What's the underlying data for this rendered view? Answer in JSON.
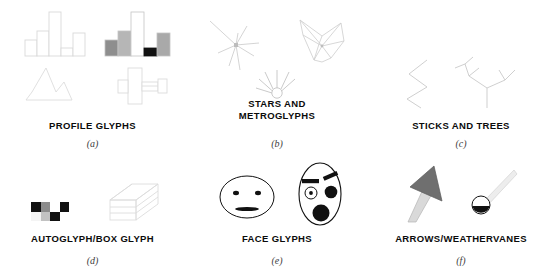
{
  "figure": {
    "title_present": false,
    "panel_count": 6,
    "stroke_color_faint": "#dadada",
    "stroke_color_light": "#c9c9c9",
    "ink_color": "#111111",
    "gray_mid": "#9a9a9a",
    "gray_dark": "#6f6f6f",
    "gray_light": "#cfcfcf"
  },
  "panels": [
    {
      "key": "a",
      "caption": "PROFILE GLYPHS",
      "sublabel": "(a)",
      "glyphs": [
        {
          "name": "outline-bar-profile",
          "type": "bar",
          "fill": "none",
          "bars": [
            {
              "height": 14,
              "fill": "#ffffff"
            },
            {
              "height": 22,
              "fill": "#ffffff"
            },
            {
              "height": 43,
              "fill": "#ffffff"
            },
            {
              "height": 6,
              "fill": "#ffffff"
            },
            {
              "height": 19,
              "fill": "#ffffff"
            }
          ]
        },
        {
          "name": "shaded-bar-profile",
          "type": "bar",
          "fill": "gray-scale",
          "bars": [
            {
              "height": 14,
              "fill": "#8f8f8f"
            },
            {
              "height": 22,
              "fill": "#b4b4b4"
            },
            {
              "height": 43,
              "fill": "#ffffff"
            },
            {
              "height": 6,
              "fill": "#111111"
            },
            {
              "height": 21,
              "fill": "#a8a8a8"
            }
          ]
        },
        {
          "name": "line-profile-glyph",
          "type": "polyline",
          "points": "0,34 6,26 18,2 27,22 34,34"
        },
        {
          "name": "box-profile-glyph",
          "type": "boxed-profile"
        }
      ]
    },
    {
      "key": "b",
      "caption": "STARS AND METROGLYPHS",
      "caption_lines": [
        "STARS AND",
        "METROGLYPHS"
      ],
      "sublabel": "(b)",
      "glyphs": [
        {
          "name": "star-glyph",
          "type": "star-rays",
          "rays": [
            {
              "angle": 205,
              "length": 26
            },
            {
              "angle": 250,
              "length": 12
            },
            {
              "angle": 290,
              "length": 21
            },
            {
              "angle": 330,
              "length": 24
            },
            {
              "angle": 20,
              "length": 14
            },
            {
              "angle": 70,
              "length": 23
            },
            {
              "angle": 120,
              "length": 10
            },
            {
              "angle": 160,
              "length": 18
            }
          ]
        },
        {
          "name": "star-polygon-glyph",
          "type": "star-polygon",
          "vertices": 7
        },
        {
          "name": "metroglyph",
          "type": "metroglyph",
          "circle_radius": 5,
          "ray_count": 6
        }
      ]
    },
    {
      "key": "c",
      "caption": "STICKS AND TREES",
      "sublabel": "(c)",
      "glyphs": [
        {
          "name": "stick-glyph",
          "type": "zigzag",
          "points": "22,2 6,14 22,26 6,38 20,48"
        },
        {
          "name": "tree-glyph",
          "type": "tree",
          "branch_count": 6
        }
      ]
    },
    {
      "key": "d",
      "caption": "AUTOGLYPH/BOX GLYPH",
      "sublabel": "(d)",
      "glyphs": [
        {
          "name": "autoglyph",
          "type": "grid",
          "cols": 4,
          "rows": 2,
          "cells": [
            [
              "#111111",
              "#8c8c8c",
              "#ffffff",
              "#111111"
            ],
            [
              "#f2f2f2",
              "#c2c2c2",
              "#111111",
              "#ffffff"
            ]
          ]
        },
        {
          "name": "box-glyph",
          "type": "3d-box"
        }
      ]
    },
    {
      "key": "e",
      "caption": "FACE GLYPHS",
      "sublabel": "(e)",
      "glyphs": [
        {
          "name": "face-glyph-neutral",
          "type": "face",
          "shape": "wide-oval",
          "eyes": "small-dots",
          "mouth": "flat-wide",
          "brows": "none"
        },
        {
          "name": "face-glyph-expressive",
          "type": "face",
          "shape": "tall-oval",
          "eyes": "mixed-small-large",
          "mouth": "large-round",
          "brows": "angled-bars"
        }
      ]
    },
    {
      "key": "f",
      "caption": "ARROWS/WEATHERVANES",
      "sublabel": "(f)",
      "glyphs": [
        {
          "name": "arrow-glyph",
          "type": "arrow",
          "head_fill": "#6f6f6f",
          "shaft_fill": "#d6d6d6",
          "angle_deg": -35
        },
        {
          "name": "weathervane-glyph",
          "type": "weathervane",
          "cup_fill_bottom": "#111111",
          "pointer_fill": "#e3e3e3"
        }
      ]
    }
  ]
}
